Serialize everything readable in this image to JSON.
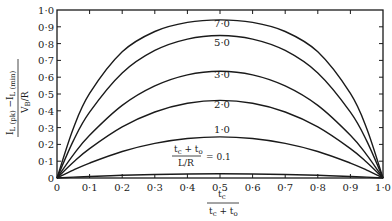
{
  "chart_data": {
    "type": "line",
    "title": "",
    "xlabel": "t_c / (t_c + t_o)",
    "ylabel": "(I_L(pk) - I_L(min)) / (V_B/R)",
    "xlim": [
      0,
      1.0
    ],
    "ylim": [
      0,
      1.0
    ],
    "grid": false,
    "x_ticks": [
      "0",
      "0·1",
      "0·2",
      "0·3",
      "0·4",
      "0·5",
      "0·6",
      "0·7",
      "0·8",
      "0·9",
      "1·0"
    ],
    "y_ticks": [
      "0",
      "0·1",
      "0·2",
      "0·3",
      "0·4",
      "0·5",
      "0·6",
      "0·7",
      "0·8",
      "0·9",
      "1·0"
    ],
    "parameter_label": "(t_c + t_o) / (L/R)",
    "annotation": "(t_c + t_o)/(L/R) = 0.1",
    "x": [
      0,
      0.05,
      0.1,
      0.2,
      0.3,
      0.4,
      0.5,
      0.6,
      0.7,
      0.8,
      0.9,
      0.95,
      1.0
    ],
    "series": [
      {
        "name": "7·0",
        "values": [
          0,
          0.295,
          0.503,
          0.751,
          0.872,
          0.926,
          0.941,
          0.926,
          0.872,
          0.751,
          0.503,
          0.295,
          0
        ]
      },
      {
        "name": "5·0",
        "values": [
          0,
          0.221,
          0.392,
          0.625,
          0.759,
          0.827,
          0.848,
          0.827,
          0.759,
          0.625,
          0.392,
          0.221,
          0
        ]
      },
      {
        "name": "3·0",
        "values": [
          0,
          0.138,
          0.254,
          0.432,
          0.548,
          0.614,
          0.635,
          0.614,
          0.548,
          0.432,
          0.254,
          0.138,
          0
        ]
      },
      {
        "name": "2·0",
        "values": [
          0,
          0.094,
          0.175,
          0.304,
          0.393,
          0.445,
          0.462,
          0.445,
          0.393,
          0.304,
          0.175,
          0.094,
          0
        ]
      },
      {
        "name": "1·0",
        "values": [
          0,
          0.047,
          0.089,
          0.158,
          0.206,
          0.235,
          0.245,
          0.235,
          0.206,
          0.158,
          0.089,
          0.047,
          0
        ]
      },
      {
        "name": "0.1",
        "values": [
          0,
          0.005,
          0.009,
          0.016,
          0.021,
          0.024,
          0.025,
          0.024,
          0.021,
          0.016,
          0.009,
          0.005,
          0
        ]
      }
    ]
  },
  "labels": {
    "curve_7": "7·0",
    "curve_5": "5·0",
    "curve_3": "3·0",
    "curve_2": "2·0",
    "curve_1": "1·0",
    "param_num": "t",
    "param_num_sub_c": "c",
    "param_plus": " + t",
    "param_num_sub_o": "o",
    "param_den": "L/R",
    "param_eq": "= 0.1",
    "x_num": "t",
    "x_num_sub": "c",
    "x_den_t": "t",
    "x_den_sub_c": "c",
    "x_den_plus": " + t",
    "x_den_sub_o": "o",
    "y_num_I1": "I",
    "y_num_sub1": "L (pk)",
    "y_num_minus": " −I",
    "y_num_sub2": "L (min)",
    "y_den": "V",
    "y_den_sub": "B",
    "y_den_rest": "/R",
    "origin_y": "0"
  }
}
